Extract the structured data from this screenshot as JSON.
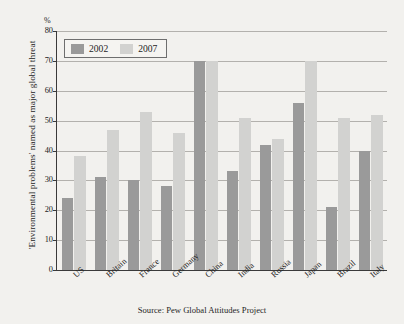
{
  "figure": {
    "percent_symbol": "%",
    "y_axis_title": "'Environmental problems' named as major global threat",
    "source_note": "Source: Pew Global Attitudes Project"
  },
  "legend": {
    "entries": [
      {
        "label": "2002",
        "color": "#9a9a9a"
      },
      {
        "label": "2007",
        "color": "#d2d2d0"
      }
    ]
  },
  "chart_data": {
    "type": "bar",
    "title": "",
    "subtitle": "",
    "xlabel": "",
    "ylabel": "'Environmental problems' named as major global threat",
    "yunit": "%",
    "ylim": [
      0,
      80
    ],
    "yticks": [
      0,
      10,
      20,
      30,
      40,
      50,
      60,
      70,
      80
    ],
    "ytick_labels": [
      "0",
      "10",
      "20",
      "30",
      "40",
      "50",
      "60",
      "70",
      "80"
    ],
    "grid": true,
    "grid_axis": "y",
    "legend_position": "top-left inside plot",
    "categories": [
      "US",
      "Britain",
      "France",
      "Germany",
      "China",
      "India",
      "Russia",
      "Japan",
      "Brazil",
      "Italy"
    ],
    "series": [
      {
        "name": "2002",
        "color": "#9a9a9a",
        "values": [
          24,
          31,
          30,
          28,
          70,
          33,
          42,
          56,
          21,
          40
        ]
      },
      {
        "name": "2007",
        "color": "#d2d2d0",
        "values": [
          38,
          47,
          53,
          46,
          70,
          51,
          44,
          70,
          51,
          52
        ]
      }
    ],
    "annotations": [],
    "source": "Pew Global Attitudes Project"
  }
}
